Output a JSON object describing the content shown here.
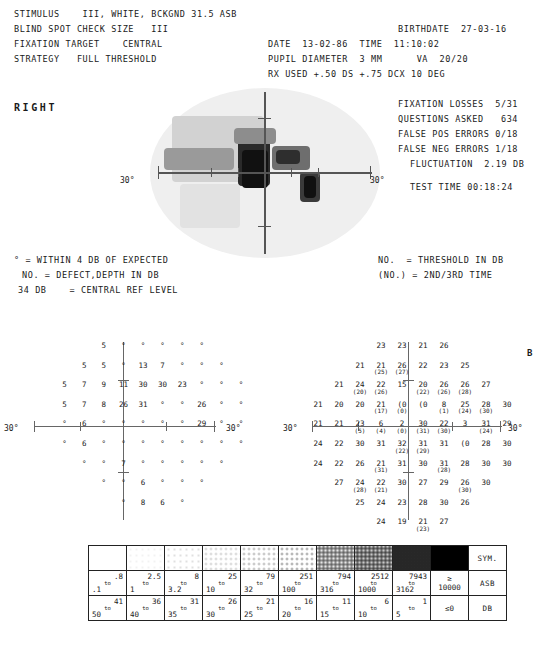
{
  "header": {
    "stimulus": "STIMULUS    III, WHITE, BCKGND 31.5 ASB",
    "blind_spot": "BLIND SPOT CHECK SIZE   III",
    "fixation_target": "FIXATION TARGET    CENTRAL",
    "strategy": "STRATEGY   FULL THRESHOLD",
    "birthdate": "BIRTHDATE  27-03-16",
    "date_time": "DATE  13-02-86  TIME  11:10:02",
    "pupil_va": "PUPIL DIAMETER  3 MM      VA  20/20",
    "rx_used": "RX USED +.50 DS +.75 DCX 10 DEG"
  },
  "eye_label": "RIGHT",
  "panel_label": "B",
  "reliability": {
    "fixation_losses": "FIXATION LOSSES  5/31",
    "questions_asked": "QUESTIONS ASKED   634",
    "false_pos": "FALSE POS ERRORS 0/18",
    "false_neg": "FALSE NEG ERRORS 1/18",
    "fluctuation": "FLUCTUATION  2.19 DB",
    "test_time": "TEST TIME 00:18:24"
  },
  "legend": {
    "left": [
      "° = WITHIN 4 DB OF EXPECTED",
      "NO. = DEFECT,DEPTH IN DB",
      "34 DB    = CENTRAL REF LEVEL"
    ],
    "right": [
      "NO.  = THRESHOLD IN DB",
      "(NO.) = 2ND/3RD TIME"
    ]
  },
  "axis_labels": {
    "left": "30°",
    "right": "30°"
  },
  "defect_grid": {
    "caption": "defect depth in DB",
    "rows": [
      {
        "y": 0,
        "cells": [
          {
            "x": 3,
            "v": "5"
          },
          {
            "x": 4,
            "v": "°"
          },
          {
            "x": 5,
            "v": "°"
          },
          {
            "x": 6,
            "v": "°"
          },
          {
            "x": 7,
            "v": "°"
          },
          {
            "x": 8,
            "v": "°"
          }
        ]
      },
      {
        "y": 1,
        "cells": [
          {
            "x": 2,
            "v": "5"
          },
          {
            "x": 3,
            "v": "5"
          },
          {
            "x": 4,
            "v": "°"
          },
          {
            "x": 5,
            "v": "13"
          },
          {
            "x": 6,
            "v": "7"
          },
          {
            "x": 7,
            "v": "°"
          },
          {
            "x": 8,
            "v": "°"
          },
          {
            "x": 9,
            "v": "°"
          }
        ]
      },
      {
        "y": 2,
        "cells": [
          {
            "x": 1,
            "v": "5"
          },
          {
            "x": 2,
            "v": "7"
          },
          {
            "x": 3,
            "v": "9"
          },
          {
            "x": 4,
            "v": "11"
          },
          {
            "x": 5,
            "v": "30"
          },
          {
            "x": 6,
            "v": "30"
          },
          {
            "x": 7,
            "v": "23"
          },
          {
            "x": 8,
            "v": "°"
          },
          {
            "x": 9,
            "v": "°"
          },
          {
            "x": 10,
            "v": "°"
          }
        ]
      },
      {
        "y": 3,
        "cells": [
          {
            "x": 1,
            "v": "5"
          },
          {
            "x": 2,
            "v": "7"
          },
          {
            "x": 3,
            "v": "8"
          },
          {
            "x": 4,
            "v": "26"
          },
          {
            "x": 5,
            "v": "31"
          },
          {
            "x": 6,
            "v": "°"
          },
          {
            "x": 7,
            "v": "°"
          },
          {
            "x": 8,
            "v": "26"
          },
          {
            "x": 9,
            "v": "°"
          },
          {
            "x": 10,
            "v": "°"
          }
        ]
      },
      {
        "y": 4,
        "cells": [
          {
            "x": 1,
            "v": "°"
          },
          {
            "x": 2,
            "v": "6"
          },
          {
            "x": 3,
            "v": "°"
          },
          {
            "x": 4,
            "v": "°"
          },
          {
            "x": 5,
            "v": "°"
          },
          {
            "x": 6,
            "v": "°"
          },
          {
            "x": 7,
            "v": "°"
          },
          {
            "x": 8,
            "v": "29"
          },
          {
            "x": 9,
            "v": "°"
          },
          {
            "x": 10,
            "v": "°"
          }
        ]
      },
      {
        "y": 5,
        "cells": [
          {
            "x": 1,
            "v": "°"
          },
          {
            "x": 2,
            "v": "6"
          },
          {
            "x": 3,
            "v": "°"
          },
          {
            "x": 4,
            "v": "°"
          },
          {
            "x": 5,
            "v": "°"
          },
          {
            "x": 6,
            "v": "°"
          },
          {
            "x": 7,
            "v": "°"
          },
          {
            "x": 8,
            "v": "°"
          },
          {
            "x": 9,
            "v": "°"
          },
          {
            "x": 10,
            "v": "°"
          }
        ]
      },
      {
        "y": 6,
        "cells": [
          {
            "x": 2,
            "v": "°"
          },
          {
            "x": 3,
            "v": "°"
          },
          {
            "x": 4,
            "v": "7"
          },
          {
            "x": 5,
            "v": "°"
          },
          {
            "x": 6,
            "v": "°"
          },
          {
            "x": 7,
            "v": "°"
          },
          {
            "x": 8,
            "v": "°"
          },
          {
            "x": 9,
            "v": "°"
          }
        ]
      },
      {
        "y": 7,
        "cells": [
          {
            "x": 3,
            "v": "°"
          },
          {
            "x": 4,
            "v": "°"
          },
          {
            "x": 5,
            "v": "6"
          },
          {
            "x": 6,
            "v": "°"
          },
          {
            "x": 7,
            "v": "°"
          },
          {
            "x": 8,
            "v": "°"
          }
        ]
      },
      {
        "y": 8,
        "cells": [
          {
            "x": 4,
            "v": "°"
          },
          {
            "x": 5,
            "v": "8"
          },
          {
            "x": 6,
            "v": "6"
          },
          {
            "x": 7,
            "v": "°"
          }
        ]
      }
    ]
  },
  "threshold_grid": {
    "caption": "threshold in DB with 2nd/3rd retest in parentheses",
    "rows": [
      {
        "y": 0,
        "cells": [
          {
            "x": 3,
            "v": "23"
          },
          {
            "x": 4,
            "v": "23"
          },
          {
            "x": 5,
            "v": "21"
          },
          {
            "x": 6,
            "v": "26"
          }
        ]
      },
      {
        "y": 1,
        "cells": [
          {
            "x": 2,
            "v": "21"
          },
          {
            "x": 3,
            "v": "21",
            "s": "(25)"
          },
          {
            "x": 4,
            "v": "26",
            "s": "(27)"
          },
          {
            "x": 5,
            "v": "22"
          },
          {
            "x": 6,
            "v": "23"
          },
          {
            "x": 7,
            "v": "25"
          }
        ]
      },
      {
        "y": 2,
        "cells": [
          {
            "x": 1,
            "v": "21"
          },
          {
            "x": 2,
            "v": "24",
            "s": "(20)"
          },
          {
            "x": 3,
            "v": "22",
            "s": "(26)"
          },
          {
            "x": 4,
            "v": "15"
          },
          {
            "x": 5,
            "v": "20",
            "s": "(22)"
          },
          {
            "x": 6,
            "v": "26",
            "s": "(26)"
          },
          {
            "x": 7,
            "v": "26",
            "s": "(28)"
          },
          {
            "x": 8,
            "v": "27"
          }
        ]
      },
      {
        "y": 3,
        "cells": [
          {
            "x": 0,
            "v": "21"
          },
          {
            "x": 1,
            "v": "20"
          },
          {
            "x": 2,
            "v": "20"
          },
          {
            "x": 3,
            "v": "21",
            "s": "(17)"
          },
          {
            "x": 4,
            "v": "(0",
            "s": "(0)"
          },
          {
            "x": 5,
            "v": "(0"
          },
          {
            "x": 6,
            "v": "8",
            "s": "(1)"
          },
          {
            "x": 7,
            "v": "25",
            "s": "(24)"
          },
          {
            "x": 8,
            "v": "28",
            "s": "(30)"
          },
          {
            "x": 9,
            "v": "30"
          }
        ]
      },
      {
        "y": 4,
        "cells": [
          {
            "x": 0,
            "v": "21"
          },
          {
            "x": 1,
            "v": "21"
          },
          {
            "x": 2,
            "v": "23",
            "s": "(5)"
          },
          {
            "x": 3,
            "v": "6",
            "s": "(4)"
          },
          {
            "x": 4,
            "v": "2",
            "s": "(0)"
          },
          {
            "x": 5,
            "v": "30",
            "s": "(31)"
          },
          {
            "x": 6,
            "v": "22",
            "s": "(30)"
          },
          {
            "x": 7,
            "v": "3"
          },
          {
            "x": 8,
            "v": "31",
            "s": "(24)"
          },
          {
            "x": 9,
            "v": "29"
          }
        ]
      },
      {
        "y": 5,
        "cells": [
          {
            "x": 0,
            "v": "24"
          },
          {
            "x": 1,
            "v": "22"
          },
          {
            "x": 2,
            "v": "30"
          },
          {
            "x": 3,
            "v": "31"
          },
          {
            "x": 4,
            "v": "32",
            "s": "(22)"
          },
          {
            "x": 5,
            "v": "31",
            "s": "(29)"
          },
          {
            "x": 6,
            "v": "31"
          },
          {
            "x": 7,
            "v": "(0"
          },
          {
            "x": 8,
            "v": "28"
          },
          {
            "x": 9,
            "v": "30"
          }
        ]
      },
      {
        "y": 6,
        "cells": [
          {
            "x": 0,
            "v": "24"
          },
          {
            "x": 1,
            "v": "22"
          },
          {
            "x": 2,
            "v": "26"
          },
          {
            "x": 3,
            "v": "21",
            "s": "(31)"
          },
          {
            "x": 4,
            "v": "31"
          },
          {
            "x": 5,
            "v": "30"
          },
          {
            "x": 6,
            "v": "31",
            "s": "(28)"
          },
          {
            "x": 7,
            "v": "28"
          },
          {
            "x": 8,
            "v": "30"
          },
          {
            "x": 9,
            "v": "30"
          }
        ]
      },
      {
        "y": 7,
        "cells": [
          {
            "x": 1,
            "v": "27"
          },
          {
            "x": 2,
            "v": "24",
            "s": "(28)"
          },
          {
            "x": 3,
            "v": "22",
            "s": "(21)"
          },
          {
            "x": 4,
            "v": "30"
          },
          {
            "x": 5,
            "v": "27"
          },
          {
            "x": 6,
            "v": "29"
          },
          {
            "x": 7,
            "v": "26",
            "s": "(30)"
          },
          {
            "x": 8,
            "v": "30"
          }
        ]
      },
      {
        "y": 8,
        "cells": [
          {
            "x": 2,
            "v": "25"
          },
          {
            "x": 3,
            "v": "24"
          },
          {
            "x": 4,
            "v": "23"
          },
          {
            "x": 5,
            "v": "28"
          },
          {
            "x": 6,
            "v": "30"
          },
          {
            "x": 7,
            "v": "26"
          }
        ]
      },
      {
        "y": 9,
        "cells": [
          {
            "x": 3,
            "v": "24"
          },
          {
            "x": 4,
            "v": "19"
          },
          {
            "x": 5,
            "v": "21",
            "s": "(23)"
          },
          {
            "x": 6,
            "v": "27"
          }
        ]
      }
    ]
  },
  "symbol_table": {
    "row_labels": {
      "sym": "SYM.",
      "asb": "ASB",
      "db": "DB"
    },
    "columns": [
      {
        "fill": "blank",
        "asb_top": ".8",
        "asb_bot": ".1",
        "db_top": "41",
        "db_bot": "50"
      },
      {
        "fill": "d1",
        "asb_top": "2.5",
        "asb_bot": "1",
        "db_top": "36",
        "db_bot": "40"
      },
      {
        "fill": "d2",
        "asb_top": "8",
        "asb_bot": "3.2",
        "db_top": "31",
        "db_bot": "35"
      },
      {
        "fill": "d3",
        "asb_top": "25",
        "asb_bot": "10",
        "db_top": "26",
        "db_bot": "30"
      },
      {
        "fill": "d4",
        "asb_top": "79",
        "asb_bot": "32",
        "db_top": "21",
        "db_bot": "25"
      },
      {
        "fill": "d5",
        "asb_top": "251",
        "asb_bot": "100",
        "db_top": "16",
        "db_bot": "20"
      },
      {
        "fill": "d6",
        "asb_top": "794",
        "asb_bot": "316",
        "db_top": "11",
        "db_bot": "15"
      },
      {
        "fill": "d7",
        "asb_top": "2512",
        "asb_bot": "1000",
        "db_top": "6",
        "db_bot": "10"
      },
      {
        "fill": "d8",
        "asb_top": "7943",
        "asb_bot": "3162",
        "db_top": "1",
        "db_bot": "5"
      },
      {
        "fill": "solid",
        "asb_single": "≥\n10000",
        "db_single": "≤0"
      }
    ],
    "to_label": "to"
  }
}
